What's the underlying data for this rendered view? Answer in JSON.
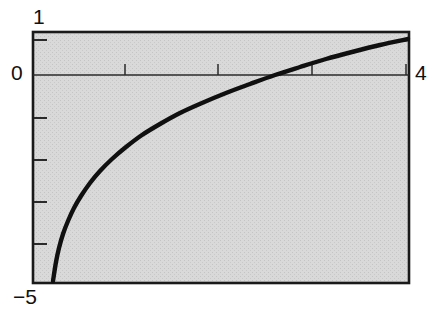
{
  "figure": {
    "background_color": "#ffffff",
    "plot_area_fill": "#d6d6d6",
    "frame_color": "#1a1a1a",
    "curve_color": "#101010"
  },
  "labels": {
    "y_max": "1",
    "y_zero": "0",
    "x_max": "4",
    "y_min": "−5"
  },
  "chart_data": {
    "type": "line",
    "title": "",
    "xlabel": "",
    "ylabel": "",
    "xlim": [
      0,
      4
    ],
    "ylim": [
      -5,
      1
    ],
    "grid": false,
    "legend": null,
    "axis_ticks": {
      "x_major_labeled": [
        "4"
      ],
      "x_minor_positions": [
        1,
        2,
        3
      ],
      "y_major_labeled": [
        "1",
        "0",
        "−5"
      ],
      "y_minor_positions": [
        -1,
        -2,
        -3,
        -4
      ]
    },
    "zero_line": true,
    "series": [
      {
        "name": "curve",
        "x": [
          0.19,
          0.25,
          0.3,
          0.35,
          0.4,
          0.45,
          0.5,
          0.6,
          0.7,
          0.8,
          0.9,
          1.0,
          1.2,
          1.4,
          1.6,
          1.8,
          2.0,
          2.2,
          2.4,
          2.58,
          2.8,
          3.0,
          3.2,
          3.4,
          3.6,
          3.8,
          4.0
        ],
        "y": [
          -4.97,
          -4.54,
          -4.22,
          -3.97,
          -3.75,
          -3.56,
          -3.4,
          -3.13,
          -2.9,
          -2.71,
          -2.54,
          -2.39,
          -2.14,
          -1.93,
          -1.75,
          -1.6,
          -1.46,
          -1.33,
          -1.22,
          -1.13,
          -1.02,
          -0.94,
          -0.86,
          -0.78,
          -0.71,
          -0.64,
          -0.58
        ]
      }
    ],
    "curve_pixel_path": {
      "frame_px": {
        "left": 33,
        "top": 32,
        "right": 409,
        "bottom": 283
      },
      "points": [
        [
          53,
          281
        ],
        [
          56,
          262
        ],
        [
          59,
          248
        ],
        [
          63,
          234
        ],
        [
          68,
          221
        ],
        [
          74,
          208
        ],
        [
          81,
          196
        ],
        [
          90,
          183
        ],
        [
          100,
          171
        ],
        [
          112,
          159
        ],
        [
          126,
          147
        ],
        [
          142,
          135
        ],
        [
          160,
          124
        ],
        [
          180,
          113
        ],
        [
          202,
          103
        ],
        [
          226,
          93
        ],
        [
          250,
          84
        ],
        [
          275,
          75
        ],
        [
          300,
          67
        ],
        [
          326,
          59
        ],
        [
          352,
          52
        ],
        [
          380,
          45
        ],
        [
          408,
          39
        ]
      ]
    }
  }
}
